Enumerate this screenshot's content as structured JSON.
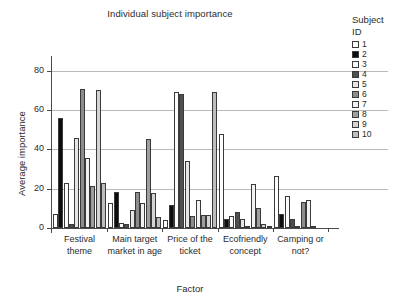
{
  "chart_data": {
    "type": "bar",
    "title": "Individual subject importance",
    "xlabel": "Factor",
    "ylabel": "Average importance",
    "ylim": [
      0,
      85
    ],
    "yticks": [
      0,
      20,
      40,
      60,
      80
    ],
    "grid": true,
    "legend_position": "right",
    "legend_title_line1": "Subject",
    "legend_title_line2": "ID",
    "categories": [
      "Festival theme",
      "Main target market in age",
      "Price of the ticket",
      "Ecofriendly concept",
      "Camping or not?"
    ],
    "category_lines": [
      [
        "Festival",
        "theme"
      ],
      [
        "Main target",
        "market in age"
      ],
      [
        "Price of the",
        "ticket"
      ],
      [
        "Ecofriendly",
        "concept"
      ],
      [
        "Camping or",
        "not?"
      ]
    ],
    "series": [
      {
        "name": "1",
        "color": "#ffffff",
        "values": [
          7,
          12.5,
          4,
          48,
          26.5
        ]
      },
      {
        "name": "2",
        "color": "#0d0d0d",
        "values": [
          56,
          18.5,
          11.5,
          4.5,
          7
        ]
      },
      {
        "name": "3",
        "color": "#fbfbfb",
        "values": [
          23,
          2.5,
          69,
          6,
          16.5
        ]
      },
      {
        "name": "4",
        "color": "#4f4f4f",
        "values": [
          2,
          2,
          68,
          8,
          4.5
        ]
      },
      {
        "name": "5",
        "color": "#e6e6e6",
        "values": [
          46,
          9,
          34,
          4.5,
          1
        ]
      },
      {
        "name": "6",
        "color": "#8c8c8c",
        "values": [
          71,
          18.5,
          6,
          1,
          13
        ]
      },
      {
        "name": "7",
        "color": "#f2f2f2",
        "values": [
          35.5,
          12.5,
          14.5,
          22.5,
          14.5
        ]
      },
      {
        "name": "8",
        "color": "#9e9e9e",
        "values": [
          21.5,
          45.5,
          6.5,
          10,
          1
        ]
      },
      {
        "name": "9",
        "color": "#d4d4d4",
        "values": [
          70,
          18,
          6.5,
          2,
          0
        ]
      },
      {
        "name": "10",
        "color": "#bdbdbd",
        "values": [
          23,
          5.5,
          69,
          1,
          0
        ]
      }
    ]
  }
}
